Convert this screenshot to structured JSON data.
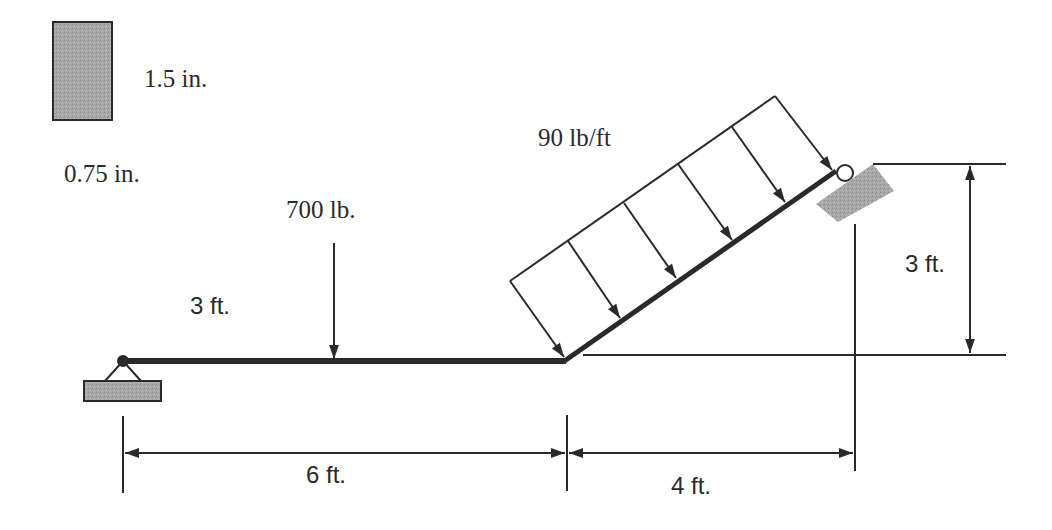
{
  "diagram": {
    "cross_section": {
      "height_label": "1.5 in.",
      "width_label": "0.75 in."
    },
    "loads": {
      "point_load_label": "700 lb.",
      "point_load_position_label": "3 ft.",
      "distributed_load_label": "90 lb/ft"
    },
    "dimensions": {
      "horizontal_span_label": "6 ft.",
      "inclined_run_label": "4 ft.",
      "inclined_rise_label": "3 ft."
    },
    "supports": {
      "left": "pin",
      "right": "roller"
    },
    "colors": {
      "line": "#2a2a2a",
      "support_fill": "#8c8c8c",
      "section_fill": "#a8a8a8"
    }
  }
}
